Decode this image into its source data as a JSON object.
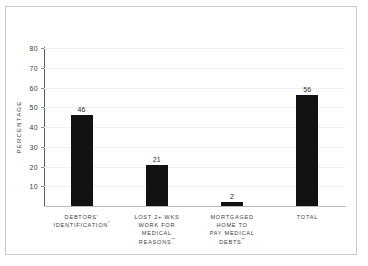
{
  "chart_data": {
    "type": "bar",
    "title": "",
    "xlabel": "",
    "ylabel": "PERCENTAGE",
    "ylim": [
      0,
      80
    ],
    "ytick_step": 10,
    "yticks": [
      10,
      20,
      30,
      40,
      50,
      60,
      70,
      80
    ],
    "grid": true,
    "legend": false,
    "categories": [
      "DEBTORS'\nIDENTIFICATION",
      "LOST 2+ WKS\nWORK FOR\nMEDICAL\nREASONS",
      "MORTGAGED\nHOME TO\nPAY MEDICAL\nDEBTS",
      "TOTAL"
    ],
    "category_markers": [
      "*",
      "**",
      "**",
      ""
    ],
    "values": [
      46,
      21,
      2,
      56
    ],
    "value_labels": [
      "46",
      "21",
      "2",
      "56"
    ],
    "bar_color": "#121212",
    "grid_color": "#f0f0f0",
    "axis_color": "#5e5e5e",
    "baseline_color": "#b9b9b9",
    "frame_color": "#c9c9c9",
    "background": "#ffffff"
  }
}
